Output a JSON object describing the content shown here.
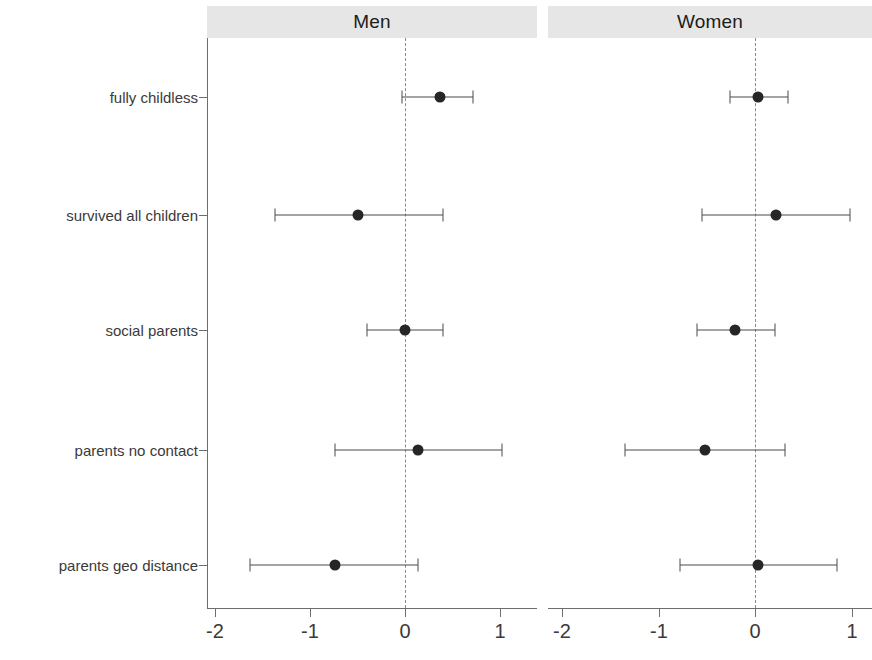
{
  "chart_data": {
    "type": "scatter",
    "subtype": "forest-plot",
    "title": "",
    "xlabel": "",
    "ylabel": "",
    "xlim": [
      -2.35,
      1.35
    ],
    "xticks": [
      -2,
      -1,
      0,
      1
    ],
    "xticklabels": [
      "-2",
      "-1",
      "0",
      "1"
    ],
    "grid": false,
    "reference_line": 0,
    "reference_line_style": "dashed",
    "legend": "none",
    "categories": [
      "fully childless",
      "survived all children",
      "social parents",
      "parents no contact",
      "parents geo distance"
    ],
    "panels": [
      {
        "label": "Men",
        "points": [
          {
            "category": "fully childless",
            "estimate": 0.37,
            "lower": -0.03,
            "upper": 0.72
          },
          {
            "category": "survived all children",
            "estimate": -0.49,
            "lower": -1.37,
            "upper": 0.4
          },
          {
            "category": "social parents",
            "estimate": 0.0,
            "lower": -0.4,
            "upper": 0.4
          },
          {
            "category": "parents no contact",
            "estimate": 0.14,
            "lower": -0.74,
            "upper": 1.02
          },
          {
            "category": "parents geo distance",
            "estimate": -0.74,
            "lower": -1.63,
            "upper": 0.14
          }
        ]
      },
      {
        "label": "Women",
        "points": [
          {
            "category": "fully childless",
            "estimate": 0.03,
            "lower": -0.26,
            "upper": 0.34
          },
          {
            "category": "survived all children",
            "estimate": 0.22,
            "lower": -0.55,
            "upper": 0.98
          },
          {
            "category": "social parents",
            "estimate": -0.21,
            "lower": -0.6,
            "upper": 0.21
          },
          {
            "category": "parents no contact",
            "estimate": -0.52,
            "lower": -1.35,
            "upper": 0.31
          },
          {
            "category": "parents geo distance",
            "estimate": 0.03,
            "lower": -0.78,
            "upper": 0.85
          }
        ]
      }
    ],
    "colors": {
      "point": "#262626",
      "interval": "#4a4a4a",
      "axis": "#6d6d6d",
      "strip_background": "#e6e6e6",
      "reference_line": "#8a8a8a",
      "background": "#ffffff",
      "text": "#3a3a3a"
    }
  },
  "layout": {
    "panel_geometry": [
      {
        "left": 207,
        "right": 537,
        "zero_px": 405,
        "unit_px": 95.0,
        "tick_px": [
          215,
          310,
          405,
          500
        ]
      },
      {
        "left": 548,
        "right": 872,
        "zero_px": 755,
        "unit_px": 96.5,
        "tick_px": [
          562,
          659,
          755,
          852
        ]
      }
    ],
    "strip_geometry": [
      {
        "left": 207,
        "width": 330
      },
      {
        "left": 548,
        "width": 324
      }
    ],
    "row_y_px": [
      97,
      215,
      330,
      450,
      565
    ],
    "panel_top_px": 38,
    "panel_height_px": 570,
    "axis_y_px": 608
  }
}
